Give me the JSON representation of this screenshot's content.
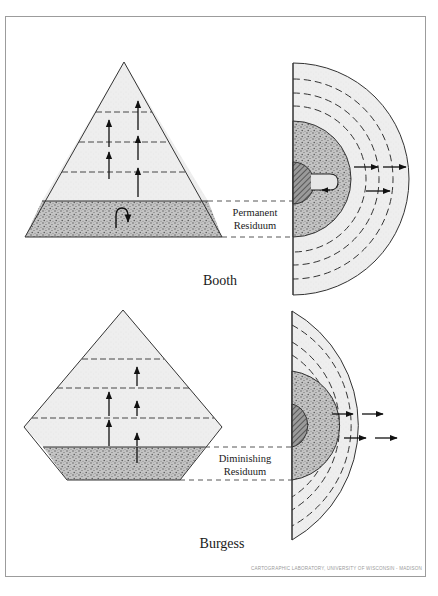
{
  "figure": {
    "panels": [
      {
        "id": "booth",
        "title": "Booth",
        "residuum_label_line1": "Permanent",
        "residuum_label_line2": "Residuum",
        "pyramid_shape": "triangle",
        "pyramid_upward_arrow_columns": 2,
        "residuum_symbol": "u-turn-arrow",
        "city_arrows_outward": 3
      },
      {
        "id": "burgess",
        "title": "Burgess",
        "residuum_label_line1": "Diminishing",
        "residuum_label_line2": "Residuum",
        "pyramid_shape": "truncated-diamond",
        "pyramid_upward_arrow_columns": 2,
        "residuum_symbol": "upward-arrow",
        "city_arrows_outward": 4
      }
    ],
    "credit": "CARTOGRAPHIC LABORATORY, UNIVERSITY OF WISCONSIN - MADISON",
    "colors": {
      "light_fill": "#ececec",
      "stipple_fill": "#b9b9b9",
      "core_fill": "#8a8a8a",
      "line": "#333333",
      "frame": "#9c9c9c"
    }
  }
}
